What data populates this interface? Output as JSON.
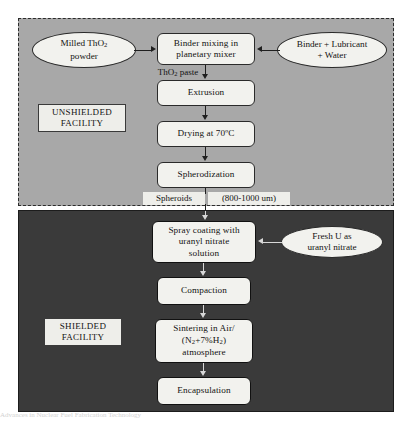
{
  "diagram": {
    "zones": [
      {
        "id": "unshielded",
        "label": "UNSHIELDED\nFACILITY",
        "label_line1": "UNSHIELDED",
        "label_line2": "FACILITY",
        "fill": "#a8a8a8",
        "border_style": "dashed"
      },
      {
        "id": "shielded",
        "label": "SHIELDED\nFACILITY",
        "label_line1": "SHIELDED",
        "label_line2": "FACILITY",
        "fill": "#3a3a3a",
        "border_style": "solid"
      }
    ],
    "nodes": [
      {
        "id": "milled-thoria",
        "shape": "ellipse",
        "zone": "unshielded",
        "line1": "Milled ThO2",
        "line2": "powder",
        "text": "Milled ThO2 powder"
      },
      {
        "id": "binder-mixing",
        "shape": "box",
        "zone": "unshielded",
        "line1": "Binder mixing in",
        "line2": "planetary mixer",
        "text": "Binder mixing in planetary mixer"
      },
      {
        "id": "binder-lubricant-water",
        "shape": "ellipse",
        "zone": "unshielded",
        "line1": "Binder + Lubricant",
        "line2": "+ Water",
        "text": "Binder + Lubricant + Water"
      },
      {
        "id": "extrusion",
        "shape": "box",
        "zone": "unshielded",
        "text": "Extrusion"
      },
      {
        "id": "drying",
        "shape": "box",
        "zone": "unshielded",
        "text": "Drying at 70ºC"
      },
      {
        "id": "spherodization",
        "shape": "box",
        "zone": "unshielded",
        "text": "Spherodization"
      },
      {
        "id": "spray-coating",
        "shape": "box",
        "zone": "shielded",
        "line1": "Spray coating with",
        "line2": "uranyl nitrate",
        "line3": "solution",
        "text": "Spray coating with uranyl nitrate solution"
      },
      {
        "id": "fresh-uranyl-nitrate",
        "shape": "ellipse",
        "zone": "shielded",
        "line1": "Fresh U as",
        "line2": "uranyl nitrate",
        "text": "Fresh U as uranyl nitrate"
      },
      {
        "id": "compaction",
        "shape": "box",
        "zone": "shielded",
        "text": "Compaction"
      },
      {
        "id": "sintering",
        "shape": "box",
        "zone": "shielded",
        "line1": "Sintering in Air/",
        "line2": "(N2+7%H2)",
        "line3": "atmosphere",
        "text": "Sintering in Air/ (N2+7%H2) atmosphere"
      },
      {
        "id": "encapsulation",
        "shape": "box",
        "zone": "shielded",
        "text": "Encapsulation"
      }
    ],
    "stream_labels": [
      {
        "id": "thoria-paste",
        "text": "ThO2 paste",
        "between": "binder-mixing -> extrusion"
      },
      {
        "id": "spheroids-size",
        "text": "Spheroids  (800-1000 um)",
        "part1": "Spheroids",
        "part2": "(800-1000 um)",
        "between": "spherodization -> spray-coating"
      }
    ],
    "edges": [
      {
        "from": "milled-thoria",
        "to": "binder-mixing",
        "direction": "right"
      },
      {
        "from": "binder-lubricant-water",
        "to": "binder-mixing",
        "direction": "left"
      },
      {
        "from": "binder-mixing",
        "to": "extrusion",
        "direction": "down"
      },
      {
        "from": "extrusion",
        "to": "drying",
        "direction": "down"
      },
      {
        "from": "drying",
        "to": "spherodization",
        "direction": "down"
      },
      {
        "from": "spherodization",
        "to": "spray-coating",
        "direction": "down"
      },
      {
        "from": "fresh-uranyl-nitrate",
        "to": "spray-coating",
        "direction": "left"
      },
      {
        "from": "spray-coating",
        "to": "compaction",
        "direction": "down"
      },
      {
        "from": "compaction",
        "to": "sintering",
        "direction": "down"
      },
      {
        "from": "sintering",
        "to": "encapsulation",
        "direction": "down"
      }
    ],
    "colors": {
      "unshielded_fill": "#a8a8a8",
      "shielded_fill": "#3a3a3a",
      "node_fill": "#f2f2ee",
      "stroke": "#1f1f1f",
      "page": "#ffffff"
    }
  },
  "page_bleed": {
    "text": "Advances in Nuclear Fuel     Fabrication Technology"
  }
}
